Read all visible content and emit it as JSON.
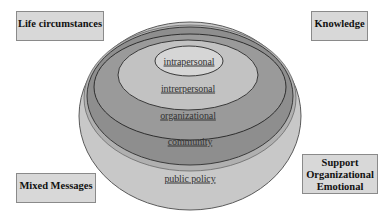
{
  "diagram": {
    "title": "",
    "type": "nested-ellipses (socio-ecological model)",
    "layers": [
      {
        "id": "public-policy",
        "label": "public policy",
        "fill": "#c8c8c8",
        "cx": 190,
        "cy": 116,
        "rx": 111,
        "ry": 94,
        "label_x": 190,
        "label_y": 178
      },
      {
        "id": "community",
        "label": "community",
        "fill": "#8e8e8e",
        "cx": 190,
        "cy": 96,
        "rx": 103,
        "ry": 69,
        "label_x": 190,
        "label_y": 141
      },
      {
        "id": "organizational",
        "label": "organizational",
        "fill": "#9a9a9a",
        "cx": 190,
        "cy": 87,
        "rx": 96,
        "ry": 53,
        "label_x": 188,
        "label_y": 115
      },
      {
        "id": "interpersonal",
        "label": "intrerpersonal",
        "fill": "#c2c2c2",
        "cx": 188,
        "cy": 75,
        "rx": 70,
        "ry": 35,
        "label_x": 188,
        "label_y": 88
      },
      {
        "id": "intrapersonal",
        "label": "intrapersonal",
        "fill": "#d6d6d6",
        "cx": 189,
        "cy": 61,
        "rx": 34,
        "ry": 15,
        "label_x": 189,
        "label_y": 61
      }
    ],
    "outer_rim": {
      "fill": "#b4b4b4",
      "stroke": "#5a5a5a"
    }
  },
  "boxes": {
    "life_circumstances": {
      "lines": [
        "Life circumstances"
      ]
    },
    "knowledge": {
      "lines": [
        "Knowledge"
      ]
    },
    "mixed_messages": {
      "lines": [
        "Mixed Messages"
      ]
    },
    "support": {
      "lines": [
        "Support",
        "Organizational",
        "Emotional"
      ]
    }
  },
  "colors": {
    "box_fill": "#d8d8d8",
    "box_border": "#8a8a8a",
    "ellipse_stroke": "#3a3a3a",
    "text": "#333333"
  }
}
